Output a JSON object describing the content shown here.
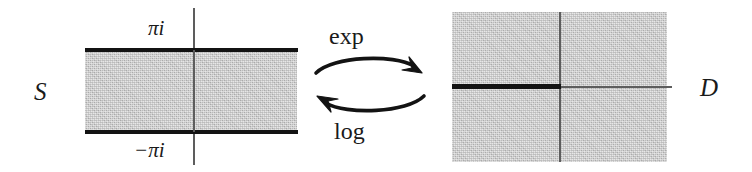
{
  "figure": {
    "caption": "",
    "colors": {
      "region_fill": "#c9c9c9",
      "boundary": "#131313",
      "axis": "#5d5d5d",
      "text": "#1a1a1a",
      "background": "#ffffff"
    }
  },
  "domain_strip": {
    "name": "S",
    "upper_boundary_label": "πi",
    "lower_boundary_label": "−πi",
    "geometry": {
      "left": 85,
      "top": 50,
      "width": 212,
      "height": 82,
      "imaginary_axis_x": 193,
      "imaginary_axis_top": 8,
      "imaginary_axis_bottom": 165
    }
  },
  "codomain_disc": {
    "name": "D",
    "geometry": {
      "left": 452,
      "top": 12,
      "width": 215,
      "height": 150,
      "imaginary_axis_x": 560,
      "real_axis_y": 87,
      "branch_cut_from_x": 452,
      "branch_cut_to_x": 560
    }
  },
  "maps": {
    "forward": {
      "label": "exp",
      "direction": "left-to-right"
    },
    "backward": {
      "label": "log",
      "direction": "right-to-left"
    }
  },
  "icons": {
    "forward_arrow": "curved-arrow-right-icon",
    "backward_arrow": "curved-arrow-left-icon"
  }
}
